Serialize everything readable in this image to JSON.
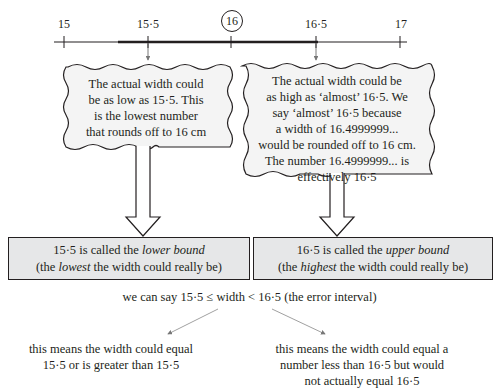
{
  "number_line": {
    "ticks": [
      {
        "value": "15",
        "label": "15"
      },
      {
        "value": "15.5",
        "label": "15·5"
      },
      {
        "value": "16",
        "label": "16",
        "circled": true
      },
      {
        "value": "16.5",
        "label": "16·5"
      },
      {
        "value": "17",
        "label": "17"
      }
    ],
    "highlighted_range": [
      "15·5",
      "16·5"
    ]
  },
  "bubbles": {
    "left": {
      "lines": [
        "The actual width could",
        "be as low as 15·5. This",
        "is the lowest number",
        "that rounds off to 16 cm"
      ]
    },
    "right": {
      "lines": [
        "The actual width could be",
        "as high as ‘almost’ 16·5. We",
        "say ‘almost’ 16·5 because",
        "a width of 16.4999999...",
        "would be rounded off to 16 cm.",
        "The number 16.4999999... is",
        "effectively 16·5"
      ]
    }
  },
  "boxes": {
    "lower": {
      "line1_pre": "15·5 is called the ",
      "line1_em": "lower bound",
      "line2_pre": "(the ",
      "line2_em": "lowest",
      "line2_post": " the width could really be)"
    },
    "upper": {
      "line1_pre": "16·5 is called the ",
      "line1_em": "upper bound",
      "line2_pre": "(the ",
      "line2_em": "highest",
      "line2_post": " the width could really be)"
    }
  },
  "error_interval": "we can say 15·5 ≤ width < 16·5 (the error interval)",
  "notes": {
    "left": [
      "this means the width could equal",
      "15·5 or is greater than 15·5"
    ],
    "right": [
      "this means the width could equal a",
      "number less than 16·5 but would",
      "not actually equal 16·5"
    ]
  }
}
